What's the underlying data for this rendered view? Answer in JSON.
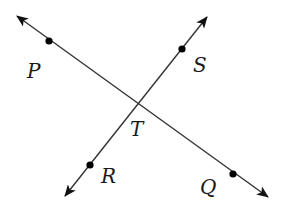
{
  "diagram": {
    "type": "intersecting-lines",
    "colors": {
      "line": "#333333",
      "point": "#000000",
      "label": "#1a1a1a",
      "background": "#ffffff"
    },
    "intersection": {
      "label": "T",
      "x": 139,
      "y": 105
    },
    "lines": [
      {
        "name": "line-PQ",
        "start": {
          "x": 17,
          "y": 16
        },
        "end": {
          "x": 268,
          "y": 197
        },
        "points": [
          {
            "label": "P",
            "x": 49,
            "y": 41,
            "label_x": 28,
            "label_y": 77
          },
          {
            "label": "Q",
            "x": 233,
            "y": 174,
            "label_x": 200,
            "label_y": 194
          }
        ]
      },
      {
        "name": "line-RS",
        "start": {
          "x": 65,
          "y": 196
        },
        "end": {
          "x": 207,
          "y": 17
        },
        "points": [
          {
            "label": "S",
            "x": 182,
            "y": 49,
            "label_x": 194,
            "label_y": 72
          },
          {
            "label": "R",
            "x": 90,
            "y": 165,
            "label_x": 101,
            "label_y": 182
          }
        ]
      }
    ],
    "labels": {
      "P": "P",
      "Q": "Q",
      "R": "R",
      "S": "S",
      "T": "T"
    }
  }
}
